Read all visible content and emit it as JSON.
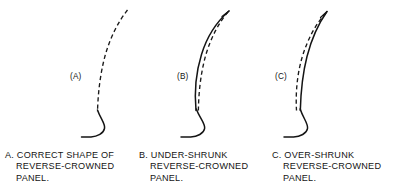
{
  "figure": {
    "background_color": "#ffffff",
    "ink_color": "#141414",
    "panels": [
      {
        "key": "a",
        "label": "(A)",
        "solid_curve_present": false,
        "dashed_curve_present": true,
        "description": "correct shape, dashed profile only with solid flange hook at base"
      },
      {
        "key": "b",
        "label": "(B)",
        "solid_curve_present": true,
        "dashed_curve_present": true,
        "description": "solid actual profile bulges to the left of the dashed correct profile"
      },
      {
        "key": "c",
        "label": "(C)",
        "solid_curve_present": true,
        "dashed_curve_present": true,
        "description": "solid actual profile bulges to the right of the dashed correct profile"
      }
    ]
  },
  "captions": {
    "a": {
      "line1": "A.  CORRECT SHAPE OF",
      "line2": "REVERSE-CROWNED",
      "line3": "PANEL."
    },
    "b": {
      "line1": "B.  UNDER-SHRUNK",
      "line2": "REVERSE-CROWNED",
      "line3": "PANEL."
    },
    "c": {
      "line1": "C.  OVER-SHRUNK",
      "line2": "REVERSE-CROWNED",
      "line3": "PANEL."
    }
  }
}
